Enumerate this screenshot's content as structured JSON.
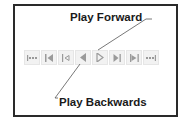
{
  "annotations": {
    "play_forward": "Play Forward",
    "play_backwards": "Play Backwards"
  },
  "toolbar": {
    "buttons": [
      {
        "name": "go-to-first",
        "icon": "first-icon"
      },
      {
        "name": "step-to-start",
        "icon": "skip-start-icon"
      },
      {
        "name": "step-back",
        "icon": "step-back-icon"
      },
      {
        "name": "play-backwards",
        "icon": "play-backwards-icon"
      },
      {
        "name": "play-forward",
        "icon": "play-forward-icon"
      },
      {
        "name": "step-forward",
        "icon": "step-forward-icon"
      },
      {
        "name": "step-to-end",
        "icon": "skip-end-icon"
      },
      {
        "name": "go-to-last",
        "icon": "last-icon"
      }
    ]
  },
  "colors": {
    "icon": "#9a9a9a",
    "frame": "#2a2a2a",
    "button_bg": "#f2f2f2"
  }
}
